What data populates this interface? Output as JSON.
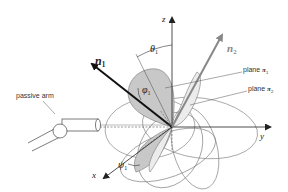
{
  "diagram": {
    "type": "3D coordinate frame with orientation vectors and planes",
    "axes": {
      "x": "x",
      "y": "y",
      "z": "z"
    },
    "vectors": {
      "n1": {
        "symbol": "n",
        "subscript": "1",
        "color": "#111111"
      },
      "n2": {
        "symbol": "n",
        "subscript": "2",
        "color": "#888888"
      }
    },
    "angles": {
      "theta1": {
        "symbol": "θ",
        "subscript": "1"
      },
      "phi1": {
        "symbol": "φ",
        "subscript": "1"
      },
      "psi1": {
        "symbol": "ψ",
        "subscript": "1"
      }
    },
    "labels": {
      "passive_arm": "passive arm",
      "plane1": {
        "prefix": "plane ",
        "symbol": "π",
        "subscript": "1"
      },
      "plane2": {
        "prefix": "plane ",
        "symbol": "π",
        "subscript": "2"
      }
    },
    "colors": {
      "plane1_fill": "#c8c8c8",
      "plane2_fill": "#ececec",
      "line": "#555555"
    }
  }
}
